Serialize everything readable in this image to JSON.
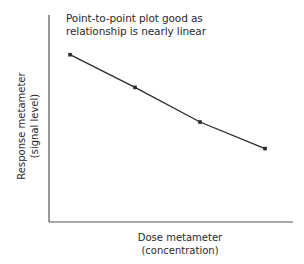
{
  "chart_data": {
    "type": "line",
    "title": "",
    "annotation": [
      "Point-to-point plot good as",
      "relationship is nearly linear"
    ],
    "xlabel": [
      "Dose metameter",
      "(concentration)"
    ],
    "ylabel": [
      "Response metameter",
      "(signal level)"
    ],
    "x": [
      1,
      2,
      3,
      4
    ],
    "series": [
      {
        "name": "response",
        "values": [
          0.82,
          0.66,
          0.49,
          0.36
        ]
      }
    ],
    "xlim": [
      0,
      4.6
    ],
    "ylim": [
      0,
      1
    ],
    "grid": false,
    "ticks": false,
    "legend": "none"
  },
  "colors": {
    "line": "#2a2a2a",
    "axis": "#555555",
    "text": "#2a2a2a",
    "background": "#ffffff"
  }
}
